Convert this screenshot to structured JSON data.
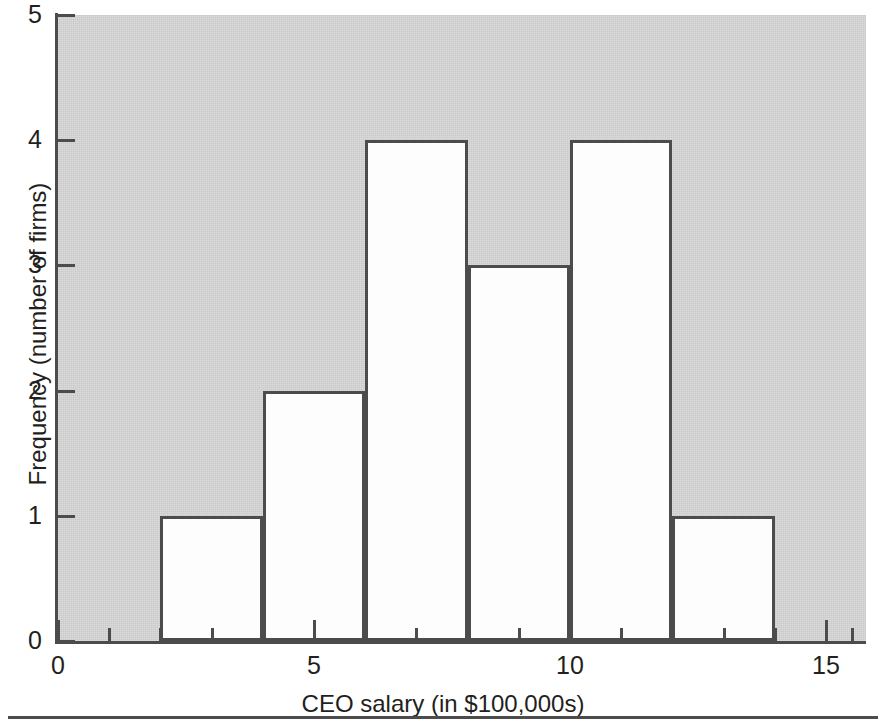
{
  "chart_data": {
    "type": "bar",
    "title": "",
    "subtitle": "",
    "xlabel": "CEO salary (in $100,000s)",
    "ylabel": "Frequency (number of firms)",
    "xlim": [
      0,
      15.75
    ],
    "ylim": [
      0,
      5
    ],
    "grid": false,
    "legend": null,
    "bin_width": 2,
    "categories": [
      "2-4",
      "4-6",
      "6-8",
      "8-10",
      "10-12",
      "12-14"
    ],
    "bins": [
      {
        "left": 2,
        "right": 4,
        "frequency": 1
      },
      {
        "left": 4,
        "right": 6,
        "frequency": 2
      },
      {
        "left": 6,
        "right": 8,
        "frequency": 4
      },
      {
        "left": 8,
        "right": 10,
        "frequency": 3
      },
      {
        "left": 10,
        "right": 12,
        "frequency": 4
      },
      {
        "left": 12,
        "right": 14,
        "frequency": 1
      }
    ],
    "values": [
      1,
      2,
      4,
      3,
      4,
      1
    ],
    "x_major_ticks": [
      0,
      5,
      10,
      15
    ],
    "x_major_tick_labels": [
      "0",
      "5",
      "10",
      "15"
    ],
    "x_minor_ticks": [
      1,
      2,
      3,
      4,
      6,
      7,
      8,
      9,
      11,
      12,
      13,
      14,
      15.5
    ],
    "y_ticks": [
      0,
      1,
      2,
      3,
      4,
      5
    ],
    "y_tick_labels": [
      "0",
      "1",
      "2",
      "3",
      "4",
      "5"
    ],
    "colors": {
      "plot_background": "#c9c9c9",
      "bar_fill": "#fdfdfd",
      "bar_outline": "#4c4c4c",
      "axis": "#4c4c4c",
      "text": "#231f20",
      "figure_background": "#ffffff"
    }
  }
}
